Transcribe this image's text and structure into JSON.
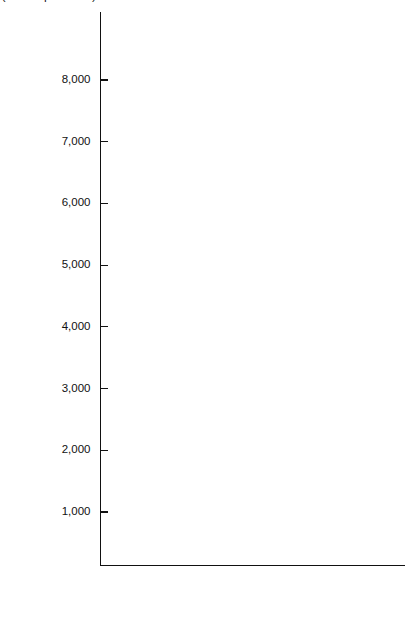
{
  "chart_data": {
    "type": "line",
    "title": "",
    "subtitle": "",
    "xlabel": "",
    "ylabel": "Million Metric Tons (Coal Equivalents)",
    "xlim": [
      1950,
      1976
    ],
    "ylim": [
      0,
      9000
    ],
    "xticks": [
      1950,
      1955,
      1960,
      1965,
      1970,
      1975,
      1976
    ],
    "xtick_labels": [
      "1950",
      "1955",
      "1960",
      "1965",
      "1970",
      "1975",
      "1976"
    ],
    "xticks_minor_interval": 1,
    "yticks": [
      1000,
      2000,
      3000,
      4000,
      5000,
      6000,
      7000,
      8000
    ],
    "ytick_labels": [
      "1,000",
      "2,000",
      "3,000",
      "4,000",
      "5,000",
      "6,000",
      "7,000",
      "8,000"
    ],
    "grid": false,
    "legend_position": "inline-annotations",
    "x": [
      1950,
      1951,
      1952,
      1953,
      1954,
      1955,
      1956,
      1957,
      1958,
      1959,
      1960,
      1961,
      1962,
      1963,
      1964,
      1965,
      1966,
      1967,
      1968,
      1969,
      1970,
      1971,
      1972,
      1973,
      1974,
      1975,
      1976
    ],
    "note": "Cumulative (stacked) boundary curves of world energy consumption; each series value is the running total at that boundary.",
    "series": [
      {
        "name": "United States",
        "label": "United States",
        "values": [
          1180,
          1215,
          1200,
          1235,
          1175,
          1270,
          1320,
          1320,
          1290,
          1345,
          1375,
          1385,
          1450,
          1510,
          1570,
          1635,
          1720,
          1770,
          1860,
          1955,
          2010,
          2025,
          2095,
          2160,
          2090,
          2025,
          2090
        ]
      },
      {
        "name": "Canada",
        "label": "Canada",
        "values": [
          1255,
          1290,
          1275,
          1305,
          1245,
          1345,
          1400,
          1400,
          1370,
          1425,
          1455,
          1470,
          1540,
          1600,
          1665,
          1735,
          1825,
          1880,
          1975,
          2075,
          2140,
          2165,
          2245,
          2320,
          2260,
          2205,
          2280
        ]
      },
      {
        "name": "Middle East",
        "label": "Middle East",
        "values": [
          1290,
          1325,
          1310,
          1340,
          1285,
          1385,
          1440,
          1440,
          1415,
          1470,
          1500,
          1520,
          1590,
          1655,
          1720,
          1795,
          1890,
          1950,
          2045,
          2150,
          2225,
          2250,
          2300,
          2350,
          2345,
          2330,
          2330
        ]
      },
      {
        "name": "U.S.S.R.",
        "label": "U.S.S.R.",
        "values": [
          1540,
          1605,
          1610,
          1665,
          1640,
          1745,
          1800,
          1800,
          1790,
          1865,
          1925,
          1970,
          2065,
          2155,
          2250,
          2350,
          2470,
          2560,
          2690,
          2840,
          2955,
          3035,
          3170,
          3350,
          3460,
          4060,
          4000
        ]
      },
      {
        "name": "Western Europe",
        "label": "Western Europe",
        "values": [
          2095,
          2215,
          2230,
          2285,
          2250,
          2400,
          2480,
          2480,
          2415,
          2475,
          2545,
          2595,
          2720,
          2840,
          2965,
          3105,
          3265,
          3395,
          3575,
          3790,
          3975,
          4110,
          4350,
          4630,
          4620,
          5640,
          5610
        ]
      },
      {
        "name": "Latin America",
        "label": "Latin America",
        "values": [
          2250,
          2380,
          2400,
          2460,
          2430,
          2590,
          2660,
          2660,
          2585,
          2655,
          2745,
          2805,
          2945,
          3080,
          3215,
          3375,
          3555,
          3700,
          3905,
          4155,
          4370,
          4530,
          4805,
          5130,
          5175,
          6380,
          6320
        ]
      },
      {
        "name": "Africa",
        "label": "Africa",
        "values": [
          2300,
          2430,
          2450,
          2515,
          2485,
          2650,
          2720,
          2720,
          2645,
          2715,
          2815,
          2880,
          3025,
          3165,
          3305,
          3475,
          3665,
          3815,
          4030,
          4290,
          4520,
          4690,
          4980,
          5330,
          5390,
          6640,
          6580
        ]
      },
      {
        "name": "All other",
        "label": "All other",
        "values": [
          2660,
          2830,
          2860,
          2935,
          2905,
          3085,
          3165,
          3165,
          3075,
          3160,
          3275,
          3355,
          3520,
          3685,
          3855,
          4055,
          4280,
          4460,
          4715,
          5020,
          5295,
          5495,
          5845,
          6270,
          6365,
          7310,
          7250
        ]
      }
    ],
    "series_label_points": [
      {
        "name": "All other",
        "x": 1962.6,
        "y": 4030,
        "rotation": -52
      },
      {
        "name": "Africa",
        "x": 1970.2,
        "y": 6400,
        "rotation": -58
      },
      {
        "name": "Latin America",
        "x": 1963.0,
        "y": 3300,
        "rotation": -52
      },
      {
        "name": "Western Europe",
        "x": 1962.6,
        "y": 2680,
        "rotation": -52
      },
      {
        "name": "U.S.S.R.",
        "x": 1965.2,
        "y": 3010,
        "rotation": 0
      },
      {
        "name": "Middle East",
        "x": 1966.4,
        "y": 1960,
        "rotation": 0
      },
      {
        "name": "Canada",
        "x": 1973.4,
        "y": 2300,
        "rotation": -12
      },
      {
        "name": "United States",
        "x": 1964.3,
        "y": 1150,
        "rotation": 0
      }
    ]
  }
}
